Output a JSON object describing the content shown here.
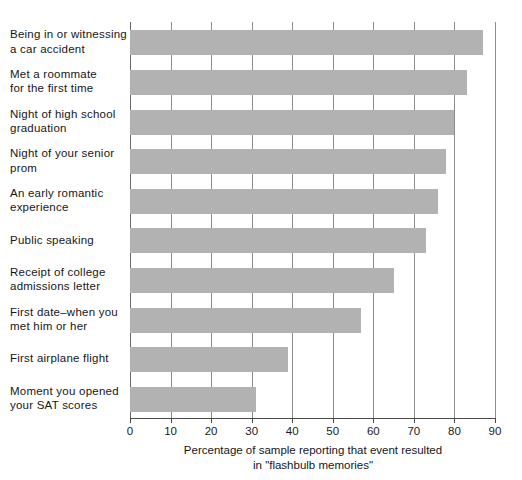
{
  "chart_data": {
    "type": "bar",
    "orientation": "horizontal",
    "title": "",
    "xlabel_lines": [
      "Percentage of sample reporting that event resulted",
      "in \"flashbulb memories\""
    ],
    "ylabel": "",
    "xlim": [
      0,
      90
    ],
    "grid": true,
    "legend": "none",
    "bar_color": "#b2b2b2",
    "xticks": [
      0,
      10,
      20,
      30,
      40,
      50,
      60,
      70,
      80,
      90
    ],
    "xtick_labels": [
      "0",
      "10",
      "20",
      "30",
      "40",
      "50",
      "60",
      "70",
      "80",
      "90"
    ],
    "categories": [
      "Being in or witnessing a car accident",
      "Met a roommate for the first time",
      "Night of high school graduation",
      "Night of your senior prom",
      "An early romantic experience",
      "Public speaking",
      "Receipt of college admissions letter",
      "First date–when you met him or her",
      "First airplane flight",
      "Moment you opened your SAT scores"
    ],
    "category_label_lines": [
      [
        "Being in or witnessing",
        "a car accident"
      ],
      [
        "Met a roommate",
        "for the first time"
      ],
      [
        "Night of high school",
        "graduation"
      ],
      [
        "Night of your senior",
        "prom"
      ],
      [
        "An early romantic",
        "experience"
      ],
      [
        "Public speaking"
      ],
      [
        "Receipt of college",
        "admissions letter"
      ],
      [
        "First date–when you",
        "met him or her"
      ],
      [
        "First airplane flight"
      ],
      [
        "Moment you opened",
        "your SAT scores"
      ]
    ],
    "values": [
      87,
      83,
      80,
      78,
      76,
      73,
      65,
      57,
      39,
      31
    ]
  }
}
